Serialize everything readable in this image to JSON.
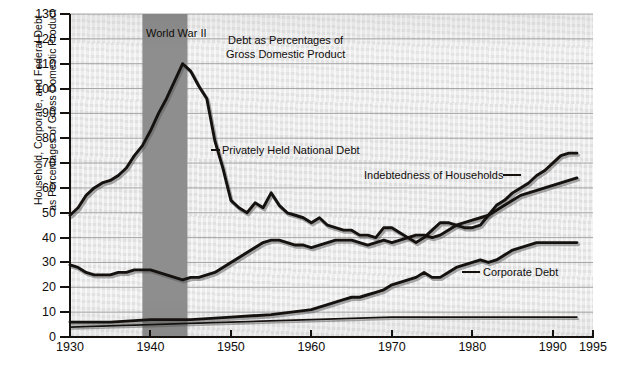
{
  "chart_data": {
    "type": "line",
    "title": "Debt as Percentages of\nGross Domestic Product",
    "title_line1": "Debt as Percentages of",
    "title_line2": "Gross Domestic Product",
    "xlabel": "",
    "ylabel_line1": "Household, Corporate, and Federal Debt",
    "ylabel_line2": "as Percentages of Gross Domestic Product",
    "xlim": [
      1930,
      1995
    ],
    "ylim": [
      0,
      130
    ],
    "xticks": [
      1930,
      1940,
      1950,
      1960,
      1970,
      1980,
      1990,
      1995
    ],
    "yticks": [
      0,
      10,
      20,
      30,
      40,
      50,
      60,
      70,
      80,
      90,
      100,
      110,
      120,
      130
    ],
    "grid": "horizontal",
    "legend_position": "inline-labels",
    "annotations": [
      {
        "name": "world-war-2-band",
        "label": "World War II",
        "x_start": 1939,
        "x_end": 1944.6
      }
    ],
    "series": [
      {
        "name": "Privately Held National Debt",
        "label": "Privately Held National Debt",
        "color": "#15110f",
        "x": [
          1930,
          1931,
          1932,
          1933,
          1934,
          1935,
          1936,
          1937,
          1938,
          1939,
          1940,
          1941,
          1942,
          1943,
          1944,
          1945,
          1946,
          1947,
          1948,
          1949,
          1950,
          1951,
          1952,
          1953,
          1954,
          1955,
          1956,
          1957,
          1958,
          1959,
          1960,
          1961,
          1962,
          1963,
          1964,
          1965,
          1966,
          1967,
          1968,
          1969,
          1970,
          1971,
          1972,
          1973,
          1974,
          1975,
          1976,
          1977,
          1978,
          1979,
          1980,
          1981,
          1982,
          1983,
          1984,
          1985,
          1986,
          1987,
          1988,
          1989,
          1990,
          1991,
          1992,
          1993
        ],
        "y": [
          49,
          52,
          57,
          60,
          62,
          63,
          65,
          68,
          73,
          77,
          83,
          90,
          96,
          103,
          110,
          107,
          101,
          96,
          79,
          68,
          55,
          52,
          50,
          54,
          52,
          58,
          53,
          50,
          49,
          48,
          46,
          48,
          45,
          44,
          43,
          43,
          41,
          41,
          40,
          44,
          44,
          42,
          40,
          38,
          40,
          43,
          46,
          46,
          45,
          44,
          44,
          45,
          49,
          53,
          55,
          58,
          60,
          62,
          65,
          67,
          70,
          73,
          74,
          74
        ]
      },
      {
        "name": "Indebtedness of Households",
        "label": "Indebtedness of Households",
        "color": "#15110f",
        "x": [
          1930,
          1931,
          1932,
          1933,
          1934,
          1935,
          1936,
          1937,
          1938,
          1939,
          1940,
          1941,
          1942,
          1943,
          1944,
          1945,
          1946,
          1947,
          1948,
          1949,
          1950,
          1951,
          1952,
          1953,
          1954,
          1955,
          1956,
          1957,
          1958,
          1959,
          1960,
          1961,
          1962,
          1963,
          1964,
          1965,
          1966,
          1967,
          1968,
          1969,
          1970,
          1971,
          1972,
          1973,
          1974,
          1975,
          1976,
          1977,
          1978,
          1979,
          1980,
          1981,
          1982,
          1983,
          1984,
          1985,
          1986,
          1987,
          1988,
          1989,
          1990,
          1991,
          1992,
          1993
        ],
        "y": [
          29,
          28,
          26,
          25,
          25,
          25,
          26,
          26,
          27,
          27,
          27,
          26,
          25,
          24,
          23,
          24,
          24,
          25,
          26,
          28,
          30,
          32,
          34,
          36,
          38,
          39,
          39,
          38,
          37,
          37,
          36,
          37,
          38,
          39,
          39,
          39,
          38,
          37,
          38,
          39,
          38,
          39,
          40,
          41,
          41,
          40,
          41,
          43,
          45,
          46,
          47,
          48,
          49,
          51,
          53,
          55,
          57,
          58,
          59,
          60,
          61,
          62,
          63,
          64
        ]
      },
      {
        "name": "Corporate Debt",
        "label": "Corporate Debt",
        "color": "#15110f",
        "x": [
          1930,
          1935,
          1940,
          1945,
          1950,
          1955,
          1960,
          1961,
          1962,
          1963,
          1964,
          1965,
          1966,
          1967,
          1968,
          1969,
          1970,
          1971,
          1972,
          1973,
          1974,
          1975,
          1976,
          1977,
          1978,
          1979,
          1980,
          1981,
          1982,
          1983,
          1984,
          1985,
          1986,
          1987,
          1988,
          1989,
          1990,
          1991,
          1992,
          1993
        ],
        "y": [
          6,
          6,
          7,
          7,
          8,
          9,
          11,
          12,
          13,
          14,
          15,
          16,
          16,
          17,
          18,
          19,
          21,
          22,
          23,
          24,
          26,
          24,
          24,
          26,
          28,
          29,
          30,
          31,
          30,
          31,
          33,
          35,
          36,
          37,
          38,
          38,
          38,
          38,
          38,
          38
        ]
      },
      {
        "name": "Lower Reference Line",
        "label": "",
        "color": "#15110f",
        "x": [
          1930,
          1940,
          1950,
          1960,
          1970,
          1980,
          1990,
          1993
        ],
        "y": [
          4,
          5,
          6,
          7,
          8,
          8,
          8,
          8
        ]
      }
    ]
  }
}
